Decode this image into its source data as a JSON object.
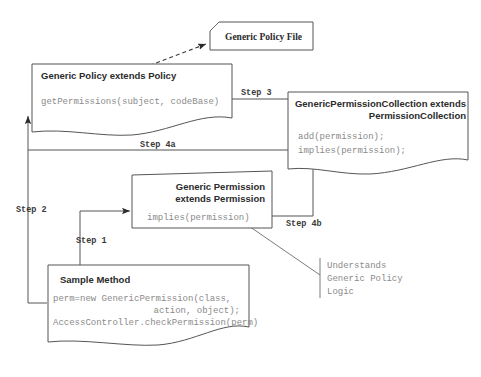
{
  "diagram": {
    "colors": {
      "background": "#ffffff",
      "box_stroke": "#555555",
      "title_text": "#2b2b2b",
      "code_text": "#8a8a8a",
      "label_text": "#3a3a3a"
    },
    "nodes": {
      "policy_file": {
        "label": "Generic Policy File"
      },
      "generic_policy": {
        "title": "Generic Policy extends Policy",
        "methods": [
          "getPermissions(subject, codeBase)"
        ]
      },
      "permission_collection": {
        "title_line1": "GenericPermissionCollection extends",
        "title_line2": "PermissionCollection",
        "methods": [
          "add(permission);",
          "implies(permission);"
        ]
      },
      "generic_permission": {
        "title_line1": "Generic Permission",
        "title_line2": "extends Permission",
        "methods": [
          "implies(permission)"
        ]
      },
      "sample_method": {
        "title": "Sample Method",
        "code": [
          "perm=new GenericPermission(class,",
          "action, object);",
          "AccessController.checkPermission(perm)"
        ]
      }
    },
    "annotations": {
      "understands": {
        "line1": "Understands",
        "line2": "Generic Policy",
        "line3": "Logic"
      }
    },
    "edges": {
      "step1": {
        "label": "Step 1"
      },
      "step2": {
        "label": "Step 2"
      },
      "step3": {
        "label": "Step 3"
      },
      "step4a": {
        "label": "Step 4a"
      },
      "step4b": {
        "label": "Step 4b"
      }
    }
  }
}
